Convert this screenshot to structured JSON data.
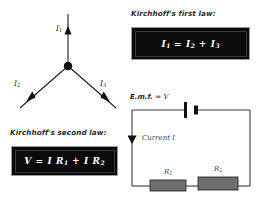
{
  "page": {
    "background": "#ffffff",
    "ink": "#1a1a1a",
    "box_fill": "#0a0a0a",
    "box_border": "#9a9a9a",
    "box_text": "#ffffff",
    "resistor_fill": "#6e6e6e"
  },
  "junction_diagram": {
    "name": "current-junction",
    "labels": {
      "top_current": "I",
      "top_current_sub": "1",
      "left_current": "I",
      "left_current_sub": "2",
      "right_current": "I",
      "right_current_sub": "3"
    }
  },
  "first_law": {
    "heading": "Kirchhoff's first law:",
    "formula_lhs": "I",
    "formula_lhs_sub": "1",
    "eq": "=",
    "term2": "I",
    "term2_sub": "2",
    "plus": "+",
    "term3": "I",
    "term3_sub": "3",
    "formula_plain": "I1 = I2 + I3"
  },
  "second_law": {
    "heading": "Kirchhoff's second law:",
    "formula_lhs": "V",
    "eq": "=",
    "term1": "I R",
    "term1_sub": "1",
    "plus": "+",
    "term2": "I R",
    "term2_sub": "2",
    "formula_plain": "V = I R1 + I R2"
  },
  "circuit_diagram": {
    "name": "series-circuit",
    "emf_label": "E.m.f.",
    "emf_eq": "=",
    "emf_value": "V",
    "current_label": "Current I",
    "resistor1": "R",
    "resistor1_sub": "1",
    "resistor2": "R",
    "resistor2_sub": "2"
  }
}
